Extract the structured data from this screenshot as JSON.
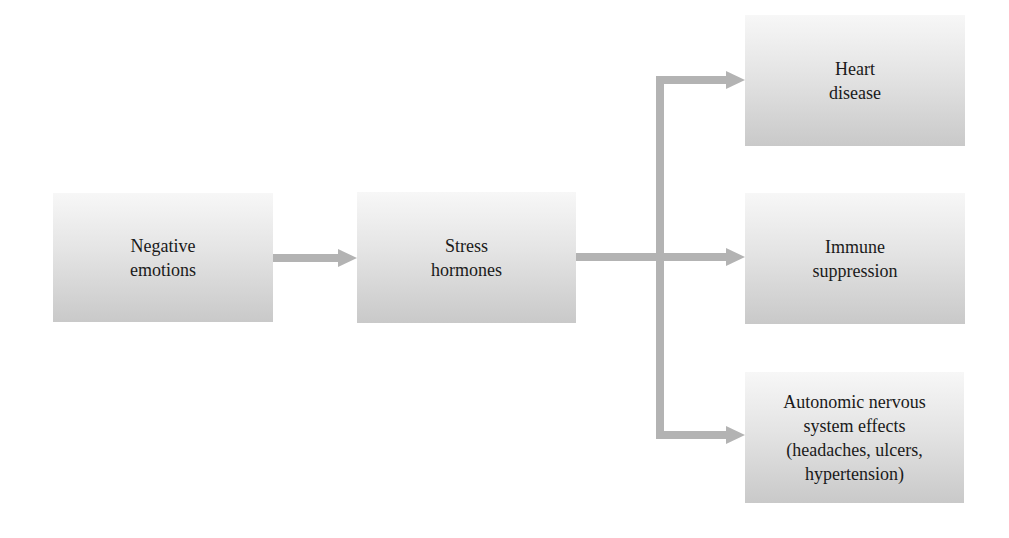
{
  "diagram": {
    "type": "flowchart",
    "nodes": [
      {
        "id": "negative",
        "label": "Negative\nemotions"
      },
      {
        "id": "stress",
        "label": "Stress\nhormones"
      },
      {
        "id": "heart",
        "label": "Heart\ndisease"
      },
      {
        "id": "immune",
        "label": "Immune\nsuppression"
      },
      {
        "id": "autonomic",
        "label": "Autonomic nervous\nsystem effects\n(headaches, ulcers,\nhypertension)"
      }
    ],
    "edges": [
      {
        "from": "negative",
        "to": "stress"
      },
      {
        "from": "stress",
        "to": "heart"
      },
      {
        "from": "stress",
        "to": "immune"
      },
      {
        "from": "stress",
        "to": "autonomic"
      }
    ],
    "colors": {
      "arrow": "#b3b3b3",
      "box_top": "#f7f7f7",
      "box_bottom": "#c9c9c9",
      "text": "#1a1a1a"
    }
  }
}
